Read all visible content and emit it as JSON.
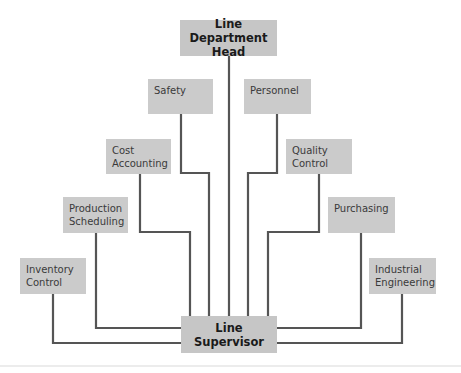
{
  "diagram": {
    "type": "organization-chart",
    "top": {
      "label": "Line Department\nHead"
    },
    "bottom": {
      "label": "Line Supervisor"
    },
    "staff_units": [
      {
        "id": "safety",
        "label": "Safety",
        "side": "left"
      },
      {
        "id": "personnel",
        "label": "Personnel",
        "side": "right"
      },
      {
        "id": "cost-accounting",
        "label": "Cost\nAccounting",
        "side": "left"
      },
      {
        "id": "quality-control",
        "label": "Quality\nControl",
        "side": "right"
      },
      {
        "id": "production-scheduling",
        "label": "Production\nScheduling",
        "side": "left"
      },
      {
        "id": "purchasing",
        "label": "Purchasing",
        "side": "right"
      },
      {
        "id": "inventory-control",
        "label": "Inventory\nControl",
        "side": "left"
      },
      {
        "id": "industrial-engineering",
        "label": "Industrial\nEngineering",
        "side": "right"
      }
    ],
    "colors": {
      "box": "#cbcbcb",
      "line": "#555555",
      "text": "#3a3a3a"
    }
  }
}
